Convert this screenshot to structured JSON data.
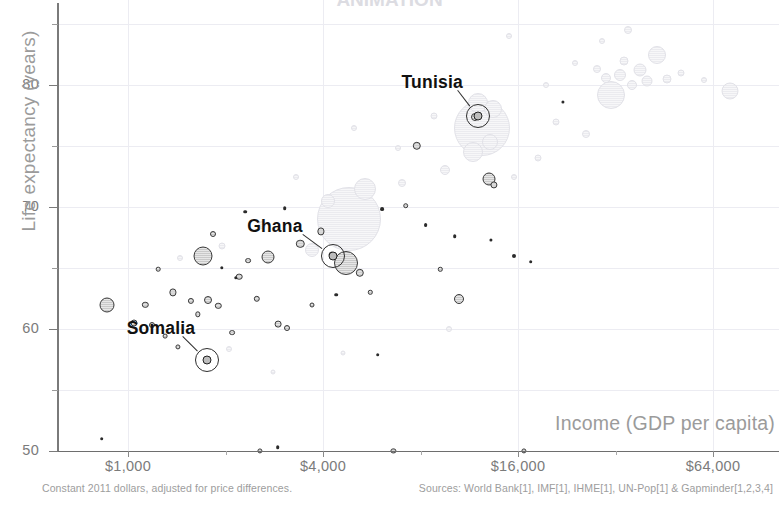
{
  "chart_title": "ANIMATION",
  "axes": {
    "y_title": "Life expectancy (years)",
    "x_title": "Income (GDP per capita)",
    "y_ticks": [
      "50",
      "60",
      "70",
      "80"
    ],
    "x_ticks": [
      "$1,000",
      "$4,000",
      "$16,000",
      "$64,000"
    ]
  },
  "footnotes": {
    "left": "Constant 2011 dollars, adjusted for price differences.",
    "right": "Sources: World Bank[1], IMF[1], IHME[1], UN-Pop[1] & Gapminder[1,2,3,4]"
  },
  "annotations": [
    {
      "label": "Somalia",
      "x": 1750,
      "y": 57.5
    },
    {
      "label": "Ghana",
      "x": 4300,
      "y": 66.0
    },
    {
      "label": "Tunisia",
      "x": 12000,
      "y": 77.5
    }
  ],
  "colors": {
    "foreground_bubble_fill": "#c9c9c9",
    "foreground_bubble_stroke": "#3a3a3a",
    "background_bubble_fill": "#ebebef",
    "axis": "#7a7a7a",
    "tick_text": "#7b7b7b",
    "axis_title": "#9b9b9b",
    "grid": "#ececf2",
    "annotation_text": "#111111",
    "footnote_text": "#9d9d9d"
  },
  "chart_data": {
    "type": "scatter",
    "title": "ANIMATION",
    "xlabel": "Income (GDP per capita)",
    "ylabel": "Life expectancy (years)",
    "x_scale": "log",
    "xlim": [
      400,
      110000
    ],
    "ylim": [
      50,
      86
    ],
    "grid": true,
    "legend": "none",
    "x_tick_values": [
      1000,
      4000,
      16000,
      64000
    ],
    "y_tick_values": [
      50,
      60,
      70,
      80
    ],
    "y_minor_tick_values": [
      55,
      65,
      75,
      85
    ],
    "bubble_size_encodes": "population",
    "series": [
      {
        "name": "Africa (highlighted)",
        "style": "foreground",
        "points": [
          {
            "x": 860,
            "y": 62.0,
            "r": 7.5
          },
          {
            "x": 1040,
            "y": 60.5,
            "r": 3.5
          },
          {
            "x": 1130,
            "y": 62.0,
            "r": 3.2
          },
          {
            "x": 1190,
            "y": 60.3,
            "r": 3.0
          },
          {
            "x": 1240,
            "y": 64.9,
            "r": 2.3
          },
          {
            "x": 1300,
            "y": 59.4,
            "r": 2.4
          },
          {
            "x": 1380,
            "y": 63.0,
            "r": 3.6
          },
          {
            "x": 1430,
            "y": 58.5,
            "r": 2.6
          },
          {
            "x": 1560,
            "y": 62.3,
            "r": 3.1
          },
          {
            "x": 1640,
            "y": 61.2,
            "r": 2.7
          },
          {
            "x": 1700,
            "y": 66.0,
            "r": 9.5
          },
          {
            "x": 1760,
            "y": 62.4,
            "r": 4.0
          },
          {
            "x": 1830,
            "y": 67.8,
            "r": 3.0
          },
          {
            "x": 1900,
            "y": 61.9,
            "r": 3.2
          },
          {
            "x": 2100,
            "y": 59.7,
            "r": 2.9
          },
          {
            "x": 2200,
            "y": 64.3,
            "r": 3.3
          },
          {
            "x": 2350,
            "y": 65.6,
            "r": 2.9
          },
          {
            "x": 2500,
            "y": 62.5,
            "r": 3.2
          },
          {
            "x": 2700,
            "y": 65.9,
            "r": 6.5
          },
          {
            "x": 2900,
            "y": 60.4,
            "r": 3.4
          },
          {
            "x": 3100,
            "y": 60.1,
            "r": 3.0
          },
          {
            "x": 3400,
            "y": 67.0,
            "r": 4.2
          },
          {
            "x": 3700,
            "y": 62.0,
            "r": 2.5
          },
          {
            "x": 3950,
            "y": 68.0,
            "r": 3.6
          },
          {
            "x": 4250,
            "y": 66.1,
            "r": 3.4
          },
          {
            "x": 4700,
            "y": 65.4,
            "r": 12.0
          },
          {
            "x": 5200,
            "y": 64.6,
            "r": 4.2
          },
          {
            "x": 5600,
            "y": 63.0,
            "r": 2.2
          },
          {
            "x": 7200,
            "y": 70.1,
            "r": 2.8
          },
          {
            "x": 7800,
            "y": 75.0,
            "r": 4.2
          },
          {
            "x": 9200,
            "y": 64.9,
            "r": 2.2
          },
          {
            "x": 10500,
            "y": 62.5,
            "r": 5.0
          },
          {
            "x": 11800,
            "y": 77.4,
            "r": 4.0
          },
          {
            "x": 13000,
            "y": 72.3,
            "r": 6.5
          },
          {
            "x": 13500,
            "y": 71.8,
            "r": 3.6
          },
          {
            "x": 15500,
            "y": 66.0,
            "r": 2.0
          },
          {
            "x": 17500,
            "y": 65.5,
            "r": 1.8
          },
          {
            "x": 830,
            "y": 51.0,
            "r": 1.8
          },
          {
            "x": 2900,
            "y": 50.3,
            "r": 1.8
          },
          {
            "x": 5900,
            "y": 57.9,
            "r": 1.8
          },
          {
            "x": 2550,
            "y": 50.0,
            "r": 2.6
          },
          {
            "x": 6600,
            "y": 50.0,
            "r": 2.6
          },
          {
            "x": 16700,
            "y": 50.0,
            "r": 2.6
          },
          {
            "x": 2300,
            "y": 69.6,
            "r": 1.8
          },
          {
            "x": 3050,
            "y": 69.9,
            "r": 1.8
          },
          {
            "x": 4400,
            "y": 62.8,
            "r": 1.8
          },
          {
            "x": 6100,
            "y": 69.8,
            "r": 1.9
          },
          {
            "x": 8300,
            "y": 68.5,
            "r": 1.9
          },
          {
            "x": 10200,
            "y": 67.6,
            "r": 1.8
          },
          {
            "x": 13200,
            "y": 67.3,
            "r": 1.6
          },
          {
            "x": 22000,
            "y": 78.6,
            "r": 1.6
          },
          {
            "x": 1950,
            "y": 65.0,
            "r": 1.7
          },
          {
            "x": 2150,
            "y": 64.2,
            "r": 1.7
          }
        ]
      },
      {
        "name": "Rest of world (dimmed)",
        "style": "background",
        "points": [
          {
            "x": 4800,
            "y": 69.0,
            "r": 32.0
          },
          {
            "x": 5400,
            "y": 71.5,
            "r": 11.0
          },
          {
            "x": 4150,
            "y": 70.5,
            "r": 7.0
          },
          {
            "x": 3700,
            "y": 66.5,
            "r": 7.0
          },
          {
            "x": 12400,
            "y": 76.5,
            "r": 28.0
          },
          {
            "x": 12000,
            "y": 78.5,
            "r": 10.0
          },
          {
            "x": 13400,
            "y": 78.0,
            "r": 9.0
          },
          {
            "x": 11600,
            "y": 74.5,
            "r": 10.0
          },
          {
            "x": 13100,
            "y": 75.3,
            "r": 8.0
          },
          {
            "x": 31000,
            "y": 79.2,
            "r": 14.0
          },
          {
            "x": 43000,
            "y": 82.5,
            "r": 9.0
          },
          {
            "x": 38000,
            "y": 81.2,
            "r": 6.5
          },
          {
            "x": 33000,
            "y": 80.8,
            "r": 6.0
          },
          {
            "x": 36000,
            "y": 80.0,
            "r": 5.0
          },
          {
            "x": 40000,
            "y": 80.3,
            "r": 5.5
          },
          {
            "x": 46000,
            "y": 80.5,
            "r": 4.5
          },
          {
            "x": 30000,
            "y": 80.6,
            "r": 5.0
          },
          {
            "x": 28000,
            "y": 81.3,
            "r": 4.0
          },
          {
            "x": 34000,
            "y": 82.0,
            "r": 4.5
          },
          {
            "x": 72000,
            "y": 79.5,
            "r": 8.5
          },
          {
            "x": 26000,
            "y": 76.0,
            "r": 4.0
          },
          {
            "x": 21000,
            "y": 77.0,
            "r": 3.5
          },
          {
            "x": 18500,
            "y": 74.0,
            "r": 3.5
          },
          {
            "x": 9500,
            "y": 73.0,
            "r": 5.0
          },
          {
            "x": 7000,
            "y": 72.0,
            "r": 4.0
          },
          {
            "x": 2600,
            "y": 68.5,
            "r": 4.0
          },
          {
            "x": 1950,
            "y": 66.8,
            "r": 3.5
          },
          {
            "x": 1450,
            "y": 65.8,
            "r": 3.0
          },
          {
            "x": 2050,
            "y": 58.4,
            "r": 3.0
          },
          {
            "x": 6800,
            "y": 74.8,
            "r": 3.0
          },
          {
            "x": 15500,
            "y": 72.5,
            "r": 3.0
          },
          {
            "x": 19500,
            "y": 80.0,
            "r": 3.0
          },
          {
            "x": 24000,
            "y": 81.8,
            "r": 3.0
          },
          {
            "x": 51000,
            "y": 81.0,
            "r": 3.5
          },
          {
            "x": 60000,
            "y": 80.4,
            "r": 3.0
          },
          {
            "x": 8800,
            "y": 77.5,
            "r": 3.5
          },
          {
            "x": 5000,
            "y": 76.5,
            "r": 3.0
          },
          {
            "x": 3300,
            "y": 72.5,
            "r": 3.0
          },
          {
            "x": 15000,
            "y": 84.0,
            "r": 3.0
          },
          {
            "x": 35000,
            "y": 84.5,
            "r": 4.0
          },
          {
            "x": 29000,
            "y": 83.6,
            "r": 3.0
          },
          {
            "x": 9800,
            "y": 60.0,
            "r": 3.0
          },
          {
            "x": 4600,
            "y": 58.0,
            "r": 2.5
          },
          {
            "x": 2800,
            "y": 56.5,
            "r": 2.5
          }
        ]
      }
    ]
  }
}
